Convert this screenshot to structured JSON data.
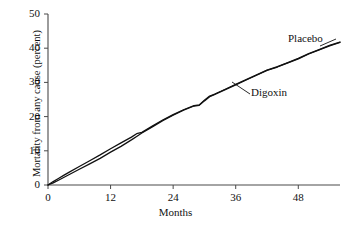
{
  "chart_data": {
    "type": "line",
    "title": "",
    "subtitle": "",
    "xlabel": "Months",
    "ylabel": "Mortality from any cause (percent)",
    "xlim": [
      0,
      56
    ],
    "ylim": [
      0,
      50
    ],
    "xticks": [
      0,
      12,
      24,
      36,
      48
    ],
    "yticks": [
      0,
      10,
      20,
      30,
      40,
      50
    ],
    "xtick_labels": [
      "0",
      "12",
      "24",
      "36",
      "48"
    ],
    "ytick_labels": [
      "0",
      "10",
      "20",
      "30",
      "40",
      "50"
    ],
    "grid": false,
    "legend_position": "inline-annotations",
    "annotations": [
      {
        "text": "Placebo",
        "x": 50,
        "y": 45
      },
      {
        "text": "Digoxin",
        "x": 41,
        "y": 28
      }
    ],
    "series": [
      {
        "name": "Placebo",
        "color": "#111111",
        "x": [
          0,
          1,
          2,
          3,
          4,
          6,
          8,
          10,
          12,
          14,
          16,
          17,
          18,
          20,
          22,
          24,
          26,
          28,
          29,
          30,
          31,
          32,
          34,
          36,
          38,
          40,
          42,
          44,
          45,
          46,
          48,
          50,
          52,
          54,
          56
        ],
        "values": [
          0,
          1.0,
          1.9,
          2.8,
          3.7,
          5.4,
          7.1,
          8.8,
          10.6,
          12.3,
          14.0,
          15.0,
          15.4,
          17.2,
          19.0,
          20.6,
          22.0,
          23.2,
          23.4,
          24.8,
          26.0,
          26.6,
          28.0,
          29.4,
          30.8,
          32.2,
          33.6,
          34.6,
          35.2,
          35.8,
          37.0,
          38.4,
          39.6,
          40.8,
          41.8
        ]
      },
      {
        "name": "Digoxin",
        "color": "#111111",
        "x": [
          0,
          1,
          2,
          3,
          4,
          6,
          8,
          10,
          12,
          14,
          16,
          17,
          18,
          20,
          22,
          24,
          26,
          28,
          29,
          30,
          31,
          32,
          34,
          36,
          38,
          40,
          42,
          44,
          45,
          46,
          48,
          50,
          52,
          54,
          56
        ],
        "values": [
          0,
          0.6,
          1.4,
          2.2,
          3.0,
          4.6,
          6.2,
          7.8,
          9.6,
          11.3,
          13.2,
          14.2,
          15.2,
          17.0,
          18.8,
          20.4,
          21.9,
          23.1,
          23.3,
          24.6,
          25.8,
          26.5,
          27.9,
          29.3,
          30.7,
          32.1,
          33.5,
          34.5,
          35.1,
          35.7,
          36.9,
          38.3,
          39.5,
          40.7,
          41.7
        ]
      }
    ]
  },
  "axes": {
    "x_title": "Months",
    "y_title": "Mortality from any cause (percent)"
  },
  "labels": {
    "placebo": "Placebo",
    "digoxin": "Digoxin"
  },
  "style": {
    "axis_color": "#4a4a4a",
    "line_color": "#111111",
    "background": "#ffffff"
  }
}
